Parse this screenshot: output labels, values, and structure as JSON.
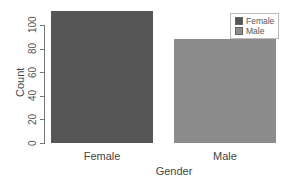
{
  "chart_data": {
    "type": "bar",
    "title": "",
    "xlabel": "Gender",
    "ylabel": "Count",
    "categories": [
      "Female",
      "Male"
    ],
    "values": [
      112,
      88
    ],
    "colors": [
      "#565656",
      "#8c8c8c"
    ],
    "ylim": [
      0,
      112
    ],
    "yticks": [
      0,
      20,
      40,
      60,
      80,
      100
    ],
    "grid": false,
    "legend": {
      "position": "top-right",
      "entries": [
        {
          "label": "Female",
          "color": "#565656"
        },
        {
          "label": "Male",
          "color": "#8c8c8c"
        }
      ]
    }
  }
}
